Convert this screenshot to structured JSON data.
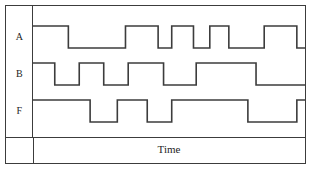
{
  "diagram": {
    "kind": "digital-timing-diagram",
    "time_axis_label": "Time",
    "line_color": "#3c3c3c",
    "frame_color": "#3c3c3c",
    "background_color": "#ffffff",
    "text_color": "#242424"
  },
  "signals": [
    {
      "name": "A",
      "label": "A",
      "row_index": 0,
      "initial_level": 1,
      "levels": [
        1,
        0,
        0,
        1,
        0,
        1,
        0,
        1,
        1,
        0,
        0,
        1
      ],
      "transitions_x": [
        0,
        13,
        34,
        46,
        51,
        59,
        65,
        72,
        85,
        91,
        97,
        101
      ],
      "description": "Input A"
    },
    {
      "name": "B",
      "label": "B",
      "row_index": 1,
      "initial_level": 1,
      "levels": [
        1,
        0,
        1,
        0,
        1,
        0,
        1,
        0,
        1,
        1,
        0,
        0
      ],
      "transitions_x": [
        0,
        9,
        18,
        27,
        36,
        45,
        54,
        63,
        72,
        81,
        90,
        99
      ],
      "description": "Input B"
    },
    {
      "name": "F",
      "label": "F",
      "row_index": 2,
      "initial_level": 1,
      "levels": [
        1,
        1,
        1,
        0,
        1,
        0,
        1,
        1,
        1,
        0,
        0,
        1
      ],
      "transitions_x": [
        0,
        13,
        34,
        46,
        51,
        59,
        65,
        72,
        85,
        91,
        97,
        101
      ],
      "description": "Output F"
    }
  ],
  "waveform_segments": {
    "A": [
      {
        "x1": 0,
        "x2": 13,
        "level": 1
      },
      {
        "x1": 13,
        "x2": 34,
        "level": 0
      },
      {
        "x1": 34,
        "x2": 46,
        "level": 1
      },
      {
        "x1": 46,
        "x2": 51,
        "level": 0
      },
      {
        "x1": 51,
        "x2": 59,
        "level": 1
      },
      {
        "x1": 59,
        "x2": 65,
        "level": 0
      },
      {
        "x1": 65,
        "x2": 72,
        "level": 1
      },
      {
        "x1": 72,
        "x2": 85,
        "level": 0
      },
      {
        "x1": 85,
        "x2": 97,
        "level": 1
      },
      {
        "x1": 97,
        "x2": 100,
        "level": 0
      }
    ],
    "B": [
      {
        "x1": 0,
        "x2": 8,
        "level": 1
      },
      {
        "x1": 8,
        "x2": 17,
        "level": 0
      },
      {
        "x1": 17,
        "x2": 26,
        "level": 1
      },
      {
        "x1": 26,
        "x2": 35,
        "level": 0
      },
      {
        "x1": 35,
        "x2": 48,
        "level": 1
      },
      {
        "x1": 48,
        "x2": 60,
        "level": 0
      },
      {
        "x1": 60,
        "x2": 82,
        "level": 1
      },
      {
        "x1": 82,
        "x2": 100,
        "level": 0
      }
    ],
    "F": [
      {
        "x1": 0,
        "x2": 21,
        "level": 1
      },
      {
        "x1": 21,
        "x2": 31,
        "level": 0
      },
      {
        "x1": 31,
        "x2": 42,
        "level": 1
      },
      {
        "x1": 42,
        "x2": 51,
        "level": 0
      },
      {
        "x1": 51,
        "x2": 79,
        "level": 1
      },
      {
        "x1": 79,
        "x2": 97,
        "level": 0
      },
      {
        "x1": 97,
        "x2": 100,
        "level": 1
      }
    ]
  },
  "geometry": {
    "width": 313,
    "height": 170,
    "wave_area_width": 272,
    "row_height": 37,
    "high_offset": 8,
    "low_offset": 30
  }
}
